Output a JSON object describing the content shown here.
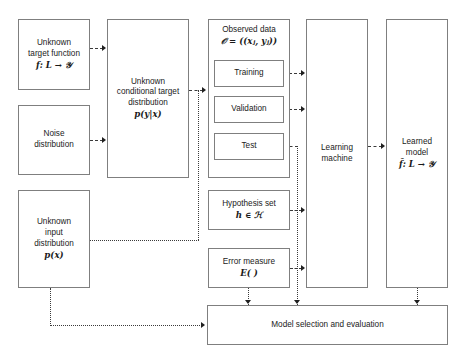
{
  "diagram": {
    "boxes": {
      "target_function": {
        "line1": "Unknown",
        "line2": "target function",
        "formula": "f: 𝑳 → 𝒴"
      },
      "noise": {
        "line1": "Noise",
        "line2": "distribution"
      },
      "input_distribution": {
        "line1": "Unknown",
        "line2": "input",
        "line3": "distribution",
        "formula": "p(x)"
      },
      "conditional_distribution": {
        "line1": "Unknown",
        "line2": "conditional target",
        "line3": "distribution",
        "formula": "p(y|x)"
      },
      "observed_data": {
        "line1": "Observed data",
        "formula": "𝒪 = ((xⱼ, yⱼ))",
        "subsets": [
          {
            "label": "Training"
          },
          {
            "label": "Validation"
          },
          {
            "label": "Test"
          }
        ]
      },
      "hypothesis_set": {
        "line1": "Hypothesis set",
        "formula": "h ∈ ℋ"
      },
      "error_measure": {
        "line1": "Error measure",
        "formula": "E( )"
      },
      "learning_machine": {
        "line1": "Learning",
        "line2": "machine"
      },
      "learned_model": {
        "line1": "Learned",
        "line2": "model",
        "formula": "f̂: 𝑳 → 𝒴"
      },
      "model_selection": {
        "label": "Model selection and evaluation"
      }
    },
    "colors": {
      "box_border": "#7f7f7f",
      "connector": "#3a3a3a",
      "arrow_head": "#1f1f1f",
      "text": "#1a1a1a",
      "background": "#ffffff"
    }
  }
}
